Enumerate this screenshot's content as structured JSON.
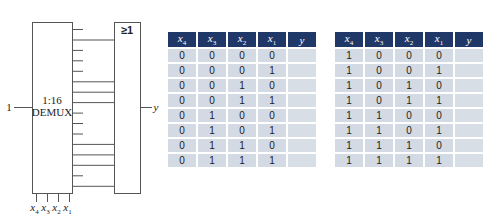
{
  "circuit": {
    "demux_label_line1": "1:16",
    "demux_label_line2": "DEMUX",
    "input_label": "1",
    "or_gate_label": "≥1",
    "output_label": "y",
    "select_labels": [
      {
        "var": "x",
        "sub": "4"
      },
      {
        "var": "x",
        "sub": "3"
      },
      {
        "var": "x",
        "sub": "2"
      },
      {
        "var": "x",
        "sub": "1"
      }
    ],
    "demux_outputs": 16,
    "connected_outputs": [
      1,
      5,
      6,
      7,
      11,
      12,
      13,
      15
    ]
  },
  "truth_tables": {
    "headers": [
      {
        "var": "x",
        "sub": "4"
      },
      {
        "var": "x",
        "sub": "3"
      },
      {
        "var": "x",
        "sub": "2"
      },
      {
        "var": "x",
        "sub": "1"
      },
      {
        "var": "y",
        "sub": ""
      }
    ],
    "left_rows": [
      [
        "0",
        "0",
        "0",
        "0",
        ""
      ],
      [
        "0",
        "0",
        "0",
        "1",
        ""
      ],
      [
        "0",
        "0",
        "1",
        "0",
        ""
      ],
      [
        "0",
        "0",
        "1",
        "1",
        ""
      ],
      [
        "0",
        "1",
        "0",
        "0",
        ""
      ],
      [
        "0",
        "1",
        "0",
        "1",
        ""
      ],
      [
        "0",
        "1",
        "1",
        "0",
        ""
      ],
      [
        "0",
        "1",
        "1",
        "1",
        ""
      ]
    ],
    "right_rows": [
      [
        "1",
        "0",
        "0",
        "0",
        ""
      ],
      [
        "1",
        "0",
        "0",
        "1",
        ""
      ],
      [
        "1",
        "0",
        "1",
        "0",
        ""
      ],
      [
        "1",
        "0",
        "1",
        "1",
        ""
      ],
      [
        "1",
        "1",
        "0",
        "0",
        ""
      ],
      [
        "1",
        "1",
        "0",
        "1",
        ""
      ],
      [
        "1",
        "1",
        "1",
        "0",
        ""
      ],
      [
        "1",
        "1",
        "1",
        "1",
        ""
      ]
    ]
  },
  "colors": {
    "header_bg": "#1f3868",
    "cell_bg": "#d3dae3",
    "line": "#555555"
  }
}
